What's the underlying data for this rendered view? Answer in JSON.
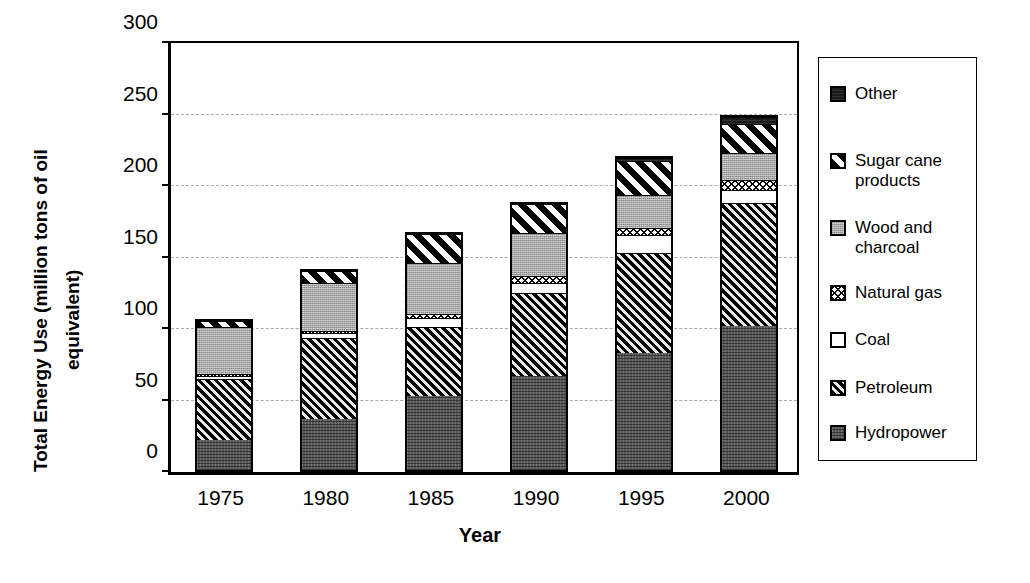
{
  "chart_data": {
    "type": "bar",
    "subtype": "stacked-bar",
    "title": "",
    "xlabel": "Year",
    "ylabel": "Total Energy Use (million tons of oil equivalent)",
    "ylabel_lines": [
      "Total Energy Use (million tons of oil",
      "equivalent)"
    ],
    "categories": [
      "1975",
      "1980",
      "1985",
      "1990",
      "1995",
      "2000"
    ],
    "ylim": [
      0,
      300
    ],
    "yticks": [
      0,
      50,
      100,
      150,
      200,
      250,
      300
    ],
    "ytick_labels": [
      "0",
      "50",
      "100",
      "150",
      "200",
      "250",
      "300"
    ],
    "grid": "horizontal-dashed",
    "legend_position": "right",
    "stack_order_bottom_to_top": [
      "Hydropower",
      "Petroleum",
      "Coal",
      "Natural gas",
      "Wood and charcoal",
      "Sugar cane products",
      "Other"
    ],
    "series": [
      {
        "name": "Hydropower",
        "pattern": "dark-gray-dotted",
        "values": [
          21,
          36,
          52,
          66,
          82,
          101
        ]
      },
      {
        "name": "Petroleum",
        "pattern": "diagonal-hatch-dark",
        "values": [
          43,
          56,
          48,
          58,
          70,
          86
        ]
      },
      {
        "name": "Coal",
        "pattern": "solid-white",
        "values": [
          2,
          4,
          6,
          7,
          12,
          9
        ]
      },
      {
        "name": "Natural gas",
        "pattern": "cross-hatch-fine",
        "values": [
          1,
          1,
          3,
          5,
          5,
          7
        ]
      },
      {
        "name": "Wood and charcoal",
        "pattern": "light-gray-stipple",
        "values": [
          33,
          34,
          36,
          30,
          23,
          19
        ]
      },
      {
        "name": "Sugar cane products",
        "pattern": "bold-diagonal-stripe",
        "values": [
          4,
          8,
          20,
          20,
          24,
          20
        ]
      },
      {
        "name": "Other",
        "pattern": "solid-black",
        "values": [
          0,
          0,
          0,
          0,
          2,
          5
        ]
      }
    ],
    "totals": [
      104,
      139,
      165,
      186,
      218,
      247
    ]
  },
  "legend": {
    "items": [
      {
        "label": "Other",
        "label_lines": "Other",
        "swatch": "solid-black"
      },
      {
        "label": "Sugar cane products",
        "label_lines": "Sugar cane\nproducts",
        "swatch": "bold-diagonal-stripe"
      },
      {
        "label": "Wood and charcoal",
        "label_lines": "Wood and\ncharcoal",
        "swatch": "light-gray-stipple"
      },
      {
        "label": "Natural gas",
        "label_lines": "Natural gas",
        "swatch": "cross-hatch-fine"
      },
      {
        "label": "Coal",
        "label_lines": "Coal",
        "swatch": "solid-white"
      },
      {
        "label": "Petroleum",
        "label_lines": "Petroleum",
        "swatch": "diagonal-hatch-dark"
      },
      {
        "label": "Hydropower",
        "label_lines": "Hydropower",
        "swatch": "dark-gray-dotted"
      }
    ]
  },
  "colors": {
    "axis": "#000000",
    "grid": "#aaaaaa",
    "background": "#ffffff",
    "hydropower": "#575757",
    "petroleum": "#4a4a4a",
    "coal": "#ffffff",
    "natural_gas": "#ffffff",
    "wood_and_charcoal": "#a9a9a9",
    "sugar_cane_products": "#ffffff",
    "other": "#1a1a1a"
  }
}
